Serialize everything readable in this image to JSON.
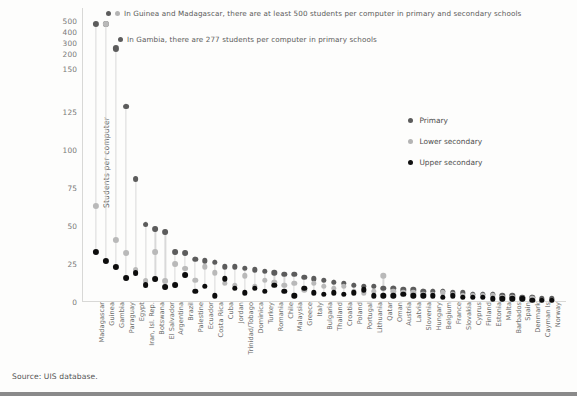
{
  "source": {
    "text": "Source: UIS database."
  },
  "annotations": [
    {
      "id": "annot-500",
      "markers": [
        "primary",
        "lower"
      ],
      "text": "In Guinea and Madagascar, there are at least 500 students per computer in primary and secondary schools"
    },
    {
      "id": "annot-277",
      "markers": [
        "primary"
      ],
      "text": "In Gambia, there are 277 students per computer in primary schools"
    }
  ],
  "legend": {
    "position": "right",
    "items": [
      {
        "label": "Primary",
        "color": "#5c5c5c"
      },
      {
        "label": "Lower secondary",
        "color": "#b9b9b9"
      },
      {
        "label": "Upper secondary",
        "color": "#0d0d0d"
      }
    ]
  },
  "chart_data": {
    "type": "scatter",
    "title": "",
    "subtitle": "",
    "xlabel": "",
    "ylabel": "Students per computer",
    "grid": false,
    "legend_position": "right",
    "yticks": [
      0,
      25,
      50,
      75,
      100,
      125,
      150,
      200,
      300,
      400,
      500
    ],
    "ylim": [
      0,
      500
    ],
    "y_scale_note": "broken axis: 0-150 linear, 150-500 compressed",
    "categories": [
      "Madagascar",
      "Guinea",
      "Gambia",
      "Paraguay",
      "Egypt",
      "Iran, Isl. Rep.",
      "Botswana",
      "El Salvador",
      "Argentina",
      "Brazil",
      "Palestine",
      "Ecuador",
      "Costa Rica",
      "Cuba",
      "Jordan",
      "Trinidad/Tobago",
      "Dominica",
      "Turkey",
      "Romania",
      "Chile",
      "Malaysia",
      "Greece",
      "Italy",
      "Bulgaria",
      "Thailand",
      "Croatia",
      "Poland",
      "Portugal",
      "Lithuania",
      "Qatar",
      "Oman",
      "Austria",
      "Latvia",
      "Slovenia",
      "Hungary",
      "Belgium",
      "France",
      "Slovakia",
      "Cyprus",
      "Finland",
      "Estonia",
      "Malta",
      "Barbados",
      "Spain",
      "Denmark",
      "Cayman Is",
      "Norway"
    ],
    "series": [
      {
        "name": "Primary",
        "color": "#5c5c5c",
        "values": [
          500,
          500,
          277,
          130,
          83,
          53,
          50,
          48,
          35,
          34,
          30,
          29,
          28,
          25,
          25,
          24,
          23,
          22,
          21,
          20,
          20,
          18,
          17,
          16,
          15,
          14,
          13,
          12,
          12,
          11,
          11,
          10,
          10,
          9,
          9,
          9,
          8,
          8,
          7,
          7,
          7,
          6,
          6,
          5,
          5,
          4,
          4
        ]
      },
      {
        "name": "Lower secondary",
        "color": "#b9b9b9",
        "values": [
          65,
          500,
          43,
          34,
          23,
          16,
          35,
          16,
          27,
          24,
          16,
          25,
          21,
          14,
          13,
          19,
          12,
          16,
          15,
          13,
          14,
          10,
          14,
          12,
          11,
          12,
          9,
          8,
          9,
          19,
          9,
          8,
          8,
          7,
          7,
          8,
          7,
          6,
          6,
          6,
          6,
          5,
          5,
          4,
          4,
          3,
          3
        ]
      },
      {
        "name": "Upper secondary",
        "color": "#0d0d0d",
        "values": [
          35,
          29,
          25,
          18,
          21,
          13,
          17,
          12,
          13,
          20,
          9,
          12,
          6,
          17,
          11,
          8,
          11,
          9,
          13,
          9,
          6,
          11,
          8,
          7,
          8,
          7,
          8,
          10,
          6,
          6,
          6,
          7,
          6,
          6,
          6,
          5,
          6,
          5,
          5,
          5,
          4,
          4,
          4,
          4,
          3,
          3,
          3
        ]
      }
    ],
    "annotated_max_note": "Guinea and Madagascar primary & secondary clipped above 500"
  }
}
